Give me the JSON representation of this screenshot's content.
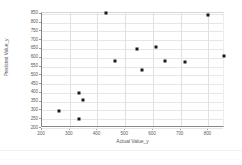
{
  "chart_data": {
    "type": "scatter",
    "title": "",
    "xlabel": "Actual Value_y",
    "ylabel": "Predicted Value_y",
    "xlim": [
      200,
      860
    ],
    "ylim": [
      200,
      855
    ],
    "xticks": [
      200,
      300,
      400,
      500,
      600,
      700,
      800
    ],
    "yticks": [
      200,
      250,
      300,
      350,
      400,
      450,
      500,
      550,
      600,
      650,
      700,
      750,
      800,
      850
    ],
    "grid": "horizontal-and-vertical",
    "legend": "none",
    "marker": "square",
    "marker_color": "#1a1a1a",
    "points": [
      {
        "x": 260,
        "y": 297
      },
      {
        "x": 333,
        "y": 400
      },
      {
        "x": 333,
        "y": 250
      },
      {
        "x": 348,
        "y": 360
      },
      {
        "x": 430,
        "y": 855
      },
      {
        "x": 462,
        "y": 582
      },
      {
        "x": 543,
        "y": 650
      },
      {
        "x": 560,
        "y": 533
      },
      {
        "x": 610,
        "y": 663
      },
      {
        "x": 645,
        "y": 580
      },
      {
        "x": 715,
        "y": 577
      },
      {
        "x": 800,
        "y": 845
      },
      {
        "x": 855,
        "y": 612
      }
    ]
  },
  "colors": {
    "axis": "#868686",
    "grid": "#e6e6e6",
    "tick_text": "#606060",
    "label_text": "#595959",
    "background": "#ffffff"
  }
}
